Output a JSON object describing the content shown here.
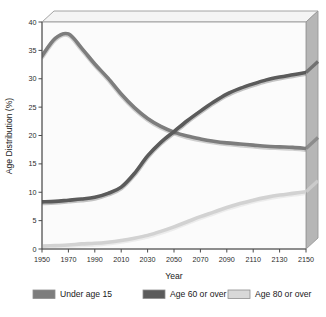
{
  "chart_data": {
    "type": "line",
    "title": "",
    "xlabel": "Year",
    "ylabel": "Age Distribution (%)",
    "xlim": [
      1950,
      2150
    ],
    "ylim": [
      0,
      40
    ],
    "grid": false,
    "legend_position": "bottom",
    "x_ticks": [
      "1950",
      "1970",
      "1990",
      "2010",
      "2030",
      "2050",
      "2070",
      "2090",
      "2110",
      "2130",
      "2150"
    ],
    "y_ticks": [
      "0",
      "5",
      "10",
      "15",
      "20",
      "25",
      "30",
      "35",
      "40"
    ],
    "x": [
      1950,
      1960,
      1970,
      1980,
      1990,
      2000,
      2010,
      2020,
      2030,
      2040,
      2050,
      2060,
      2070,
      2080,
      2090,
      2100,
      2110,
      2120,
      2130,
      2140,
      2150
    ],
    "series": [
      {
        "name": "Under age 15",
        "color": "#7d7d7d",
        "values": [
          34.0,
          37.1,
          37.9,
          35.4,
          32.6,
          30.1,
          27.3,
          24.9,
          23.0,
          21.6,
          20.6,
          19.9,
          19.4,
          19.0,
          18.7,
          18.5,
          18.3,
          18.1,
          18.0,
          17.9,
          17.7
        ]
      },
      {
        "name": "Age 60 or over",
        "color": "#5b5b5b",
        "values": [
          8.3,
          8.4,
          8.6,
          8.8,
          9.1,
          9.8,
          10.9,
          13.3,
          16.4,
          18.8,
          20.7,
          22.6,
          24.3,
          25.9,
          27.3,
          28.3,
          29.1,
          29.8,
          30.3,
          30.7,
          31.1
        ]
      },
      {
        "name": "Age 80 or over",
        "color": "#d2d2d2",
        "values": [
          0.5,
          0.6,
          0.7,
          0.9,
          1.0,
          1.2,
          1.5,
          1.9,
          2.4,
          3.1,
          3.9,
          4.8,
          5.7,
          6.5,
          7.3,
          8.0,
          8.6,
          9.1,
          9.5,
          9.8,
          10.1
        ]
      }
    ]
  },
  "legend": {
    "items": [
      {
        "label": "Under age 15",
        "color": "#7d7d7d"
      },
      {
        "label": "Age 60 or over",
        "color": "#5b5b5b"
      },
      {
        "label": "Age 80 or over",
        "color": "#d8d8d8"
      }
    ]
  },
  "colors": {
    "plot_background": "#fbfbfb",
    "panel_top": "#f2f2f2",
    "panel_right": "#b4b4b4",
    "frame_stroke": "#9a9a9a",
    "axis": "#4a4a4a"
  }
}
